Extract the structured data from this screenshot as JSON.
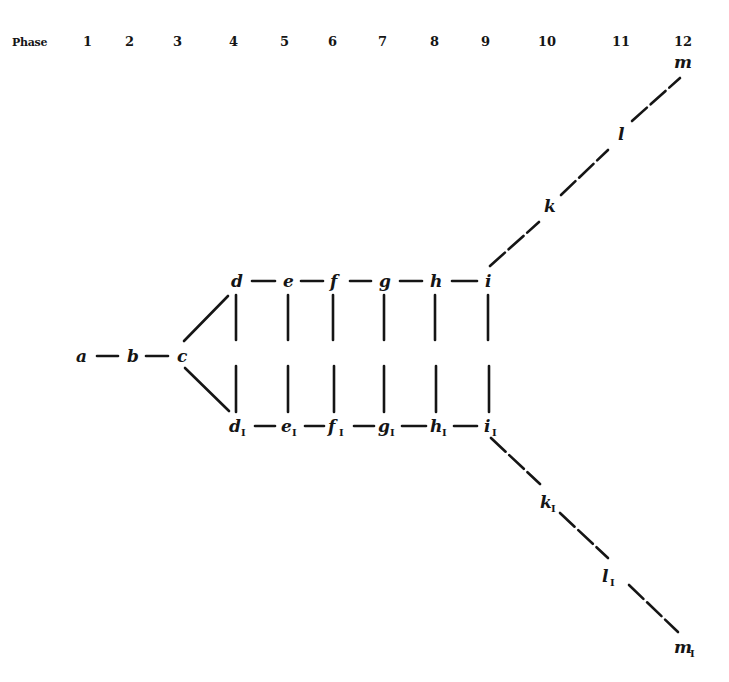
{
  "phase_row": {
    "title": "Phase",
    "labels": [
      "1",
      "2",
      "3",
      "4",
      "5",
      "6",
      "7",
      "8",
      "9",
      "10",
      "11",
      "12"
    ]
  },
  "nodes": {
    "a": {
      "label": "a",
      "sub": ""
    },
    "b": {
      "label": "b",
      "sub": ""
    },
    "c": {
      "label": "c",
      "sub": ""
    },
    "d": {
      "label": "d",
      "sub": ""
    },
    "e": {
      "label": "e",
      "sub": ""
    },
    "f": {
      "label": "f",
      "sub": ""
    },
    "g": {
      "label": "g",
      "sub": ""
    },
    "h": {
      "label": "h",
      "sub": ""
    },
    "i": {
      "label": "i",
      "sub": ""
    },
    "k": {
      "label": "k",
      "sub": ""
    },
    "l": {
      "label": "l",
      "sub": ""
    },
    "m": {
      "label": "m",
      "sub": ""
    },
    "d1": {
      "label": "d",
      "sub": "I"
    },
    "e1": {
      "label": "e",
      "sub": "I"
    },
    "f1": {
      "label": "f",
      "sub": "I"
    },
    "g1": {
      "label": "g",
      "sub": "I"
    },
    "h1": {
      "label": "h",
      "sub": "I"
    },
    "i1": {
      "label": "i",
      "sub": "I"
    },
    "k1": {
      "label": "k",
      "sub": "I"
    },
    "l1": {
      "label": "l",
      "sub": "I"
    },
    "m1": {
      "label": "m",
      "sub": "I"
    }
  },
  "edges": [
    [
      "a",
      "b"
    ],
    [
      "b",
      "c"
    ],
    [
      "c",
      "d"
    ],
    [
      "c",
      "d1"
    ],
    [
      "d",
      "e"
    ],
    [
      "e",
      "f"
    ],
    [
      "f",
      "g"
    ],
    [
      "g",
      "h"
    ],
    [
      "h",
      "i"
    ],
    [
      "d1",
      "e1"
    ],
    [
      "e1",
      "f1"
    ],
    [
      "f1",
      "g1"
    ],
    [
      "g1",
      "h1"
    ],
    [
      "h1",
      "i1"
    ],
    [
      "d",
      "d1"
    ],
    [
      "e",
      "e1"
    ],
    [
      "f",
      "f1"
    ],
    [
      "g",
      "g1"
    ],
    [
      "h",
      "h1"
    ],
    [
      "i",
      "i1"
    ],
    [
      "i",
      "k"
    ],
    [
      "k",
      "l"
    ],
    [
      "l",
      "m"
    ],
    [
      "i1",
      "k1"
    ],
    [
      "k1",
      "l1"
    ],
    [
      "l1",
      "m1"
    ]
  ]
}
